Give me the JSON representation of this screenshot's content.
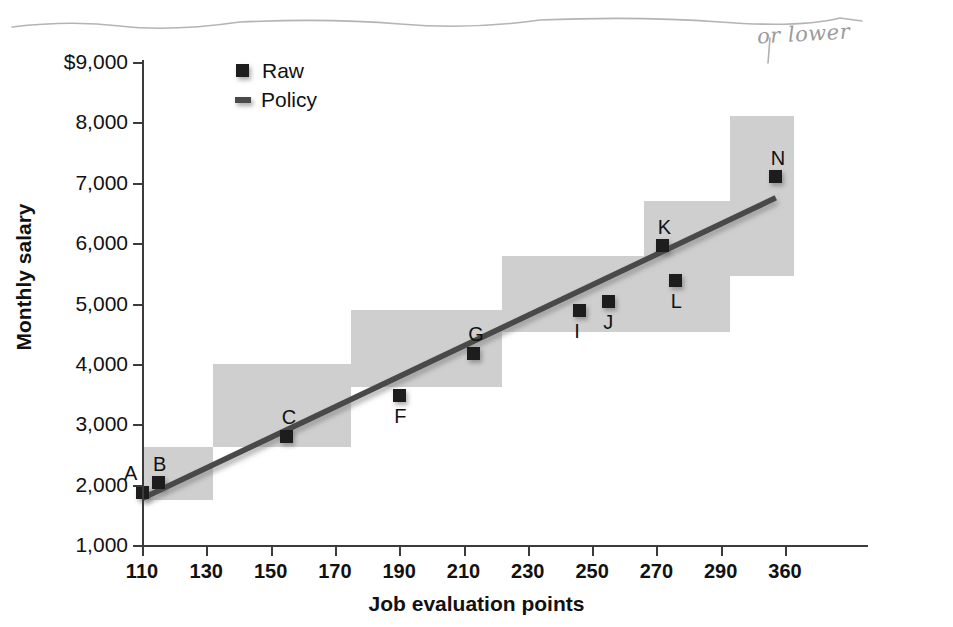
{
  "annotation": {
    "handwritten_note": "or lower"
  },
  "legend": {
    "position": "top-left-inside",
    "entries": [
      {
        "label": "Raw",
        "marker": "filled-square",
        "color": "#1d1d1d"
      },
      {
        "label": "Policy",
        "marker": "line",
        "color": "#4a4a4a"
      }
    ]
  },
  "axes": {
    "y_title": "Monthly salary",
    "x_title": "Job evaluation points",
    "y_ticks": [
      "$9,000",
      "8,000",
      "7,000",
      "6,000",
      "5,000",
      "4,000",
      "3,000",
      "2,000",
      "1,000"
    ],
    "x_ticks": [
      "110",
      "130",
      "150",
      "170",
      "190",
      "210",
      "230",
      "250",
      "270",
      "290",
      "360"
    ]
  },
  "chart_data": {
    "type": "scatter",
    "title": "",
    "xlabel": "Job evaluation points",
    "ylabel": "Monthly salary",
    "xlim": [
      110,
      370
    ],
    "ylim": [
      1000,
      9000
    ],
    "grid": false,
    "legend_position": "top-left",
    "series": [
      {
        "name": "Raw",
        "type": "scatter",
        "marker": "filled-square",
        "color": "#1d1d1d",
        "points": [
          {
            "label": "A",
            "x": 110,
            "y": 1870,
            "label_pos": "left-above"
          },
          {
            "label": "B",
            "x": 115,
            "y": 2030,
            "label_pos": "above"
          },
          {
            "label": "C",
            "x": 155,
            "y": 2800,
            "label_pos": "above"
          },
          {
            "label": "F",
            "x": 190,
            "y": 3470,
            "label_pos": "below"
          },
          {
            "label": "G",
            "x": 213,
            "y": 4180,
            "label_pos": "above"
          },
          {
            "label": "I",
            "x": 246,
            "y": 4880,
            "label_pos": "below"
          },
          {
            "label": "J",
            "x": 255,
            "y": 5030,
            "label_pos": "below"
          },
          {
            "label": "K",
            "x": 272,
            "y": 5960,
            "label_pos": "above"
          },
          {
            "label": "L",
            "x": 276,
            "y": 5380,
            "label_pos": "below"
          },
          {
            "label": "N",
            "x": 350,
            "y": 7100,
            "label_pos": "above"
          }
        ]
      },
      {
        "name": "Policy",
        "type": "line",
        "color": "#4a4a4a",
        "x": [
          110,
          350
        ],
        "y": [
          1770,
          6750
        ]
      }
    ],
    "grade_bands": [
      {
        "x_start": 110,
        "x_end": 132,
        "y_bottom": 1750,
        "y_top": 2620
      },
      {
        "x_start": 132,
        "x_end": 175,
        "y_bottom": 2620,
        "y_top": 4000
      },
      {
        "x_start": 175,
        "x_end": 222,
        "y_bottom": 3620,
        "y_top": 4900
      },
      {
        "x_start": 222,
        "x_end": 266,
        "y_bottom": 4520,
        "y_top": 5780
      },
      {
        "x_start": 266,
        "x_end": 300,
        "y_bottom": 4520,
        "y_top": 6700
      },
      {
        "x_start": 300,
        "x_end": 370,
        "y_bottom": 5450,
        "y_top": 8100
      }
    ],
    "band_color": "#cfcfcf"
  }
}
